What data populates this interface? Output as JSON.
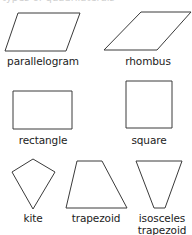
{
  "header": {
    "title_fragment": "types of quadrilaterals"
  },
  "stroke_color": "#3a3a3a",
  "shapes": [
    {
      "name": "parallelogram",
      "label": "parallelogram",
      "points": "18,13 80,13 66,51 5,51"
    },
    {
      "name": "rhombus",
      "label": "rhombus",
      "points": "141,12 191,12 157,50 104,50"
    },
    {
      "name": "rectangle",
      "label": "rectangle",
      "points": "13,91 72,91 72,129 13,129"
    },
    {
      "name": "square",
      "label": "square",
      "points": "126,81 172,81 172,128 126,128"
    },
    {
      "name": "kite",
      "label": "kite",
      "points": "33,159 55,172 33,209 12,172"
    },
    {
      "name": "trapezoid",
      "label": "trapezoid",
      "points": "77,161 102,161 127,208 66,208"
    },
    {
      "name": "isosceles-trapezoid",
      "label_line1": "isosceles",
      "label_line2": "trapezoid",
      "points": "136,161 182,161 165,208 154,208"
    }
  ]
}
